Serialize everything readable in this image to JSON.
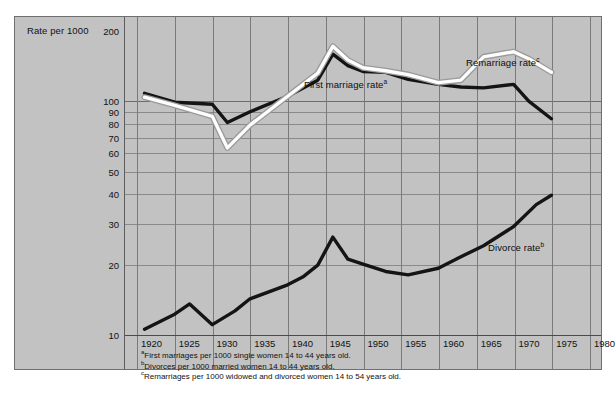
{
  "chart_data": {
    "type": "line",
    "title": "",
    "xlabel": "",
    "ylabel": "Rate per 1000",
    "scale": "log",
    "ylim": [
      10,
      200
    ],
    "xlim": [
      1920,
      1980
    ],
    "grid": true,
    "legend": "inline-annotations",
    "yticks": [
      200,
      100,
      90,
      80,
      70,
      60,
      50,
      40,
      30,
      20,
      10
    ],
    "xticks": [
      1920,
      1925,
      1930,
      1935,
      1940,
      1945,
      1950,
      1955,
      1960,
      1965,
      1970,
      1975,
      1980
    ],
    "series": [
      {
        "name": "First marriage rate",
        "marker": "a",
        "color": "#141414",
        "x": [
          1921,
          1925,
          1930,
          1932,
          1935,
          1940,
          1944,
          1946,
          1948,
          1950,
          1953,
          1956,
          1960,
          1963,
          1966,
          1970,
          1972,
          1975
        ],
        "values": [
          108,
          99,
          97,
          81,
          90,
          105,
          123,
          159,
          142,
          134,
          133,
          124,
          118,
          115,
          114,
          118,
          100,
          84
        ]
      },
      {
        "name": "Remarriage rate",
        "marker": "c",
        "color": "#fdfdfd",
        "x": [
          1921,
          1925,
          1930,
          1932,
          1935,
          1940,
          1944,
          1946,
          1948,
          1950,
          1953,
          1956,
          1960,
          1963,
          1966,
          1970,
          1972,
          1975
        ],
        "values": [
          104,
          96,
          86,
          63,
          79,
          105,
          132,
          172,
          150,
          139,
          135,
          130,
          120,
          123,
          155,
          163,
          152,
          133
        ]
      },
      {
        "name": "Divorce rate",
        "marker": "b",
        "color": "#141414",
        "x": [
          1921,
          1925,
          1927,
          1930,
          1933,
          1935,
          1940,
          1942,
          1944,
          1946,
          1948,
          1950,
          1953,
          1956,
          1960,
          1963,
          1966,
          1970,
          1973,
          1975
        ],
        "values": [
          10.5,
          12.2,
          13.5,
          11.0,
          12.6,
          14.2,
          16.3,
          17.6,
          19.8,
          26.1,
          21.0,
          20.0,
          18.6,
          18.0,
          19.2,
          21.5,
          24.0,
          29.0,
          36.0,
          39.5
        ]
      }
    ]
  },
  "axis": {
    "ylabel": "Rate per 1000",
    "yticks": [
      "200",
      "100",
      "90",
      "80",
      "70",
      "60",
      "50",
      "40",
      "30",
      "20",
      "10"
    ],
    "xticks": [
      "1920",
      "1925",
      "1930",
      "1935",
      "1940",
      "1945",
      "1950",
      "1955",
      "1960",
      "1965",
      "1970",
      "1975",
      "1980"
    ]
  },
  "annotations": [
    {
      "id": "first-marriage",
      "label": "First marriage rate",
      "marker": "a"
    },
    {
      "id": "remarriage",
      "label": "Remarriage rate",
      "marker": "c"
    },
    {
      "id": "divorce",
      "label": "Divorce rate",
      "marker": "b"
    }
  ],
  "footnotes": [
    {
      "marker": "a",
      "text": "First marriages per 1000 single women 14 to 44 years old."
    },
    {
      "marker": "b",
      "text": "Divorces per 1000 married women 14 to 44 years old."
    },
    {
      "marker": "c",
      "text": "Remarriages per 1000 widowed and divorced women 14 to 54 years old."
    }
  ],
  "colors": {
    "plate": "#c2c2c2",
    "grid": "#7a7a7a",
    "dark_series": "#141414",
    "light_series": "#fdfdfd",
    "text": "#111111"
  }
}
